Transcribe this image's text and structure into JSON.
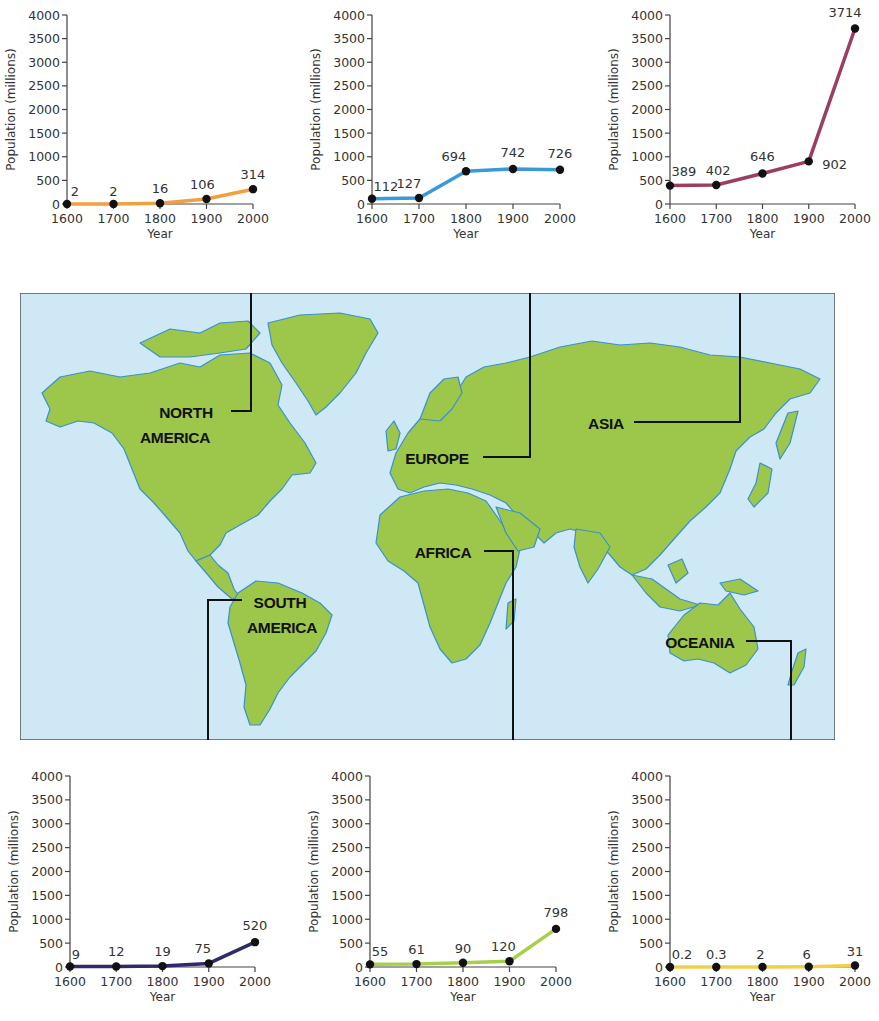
{
  "figure": {
    "map": {
      "ocean_color": "#cfe8f5",
      "land_color": "#9dc74a",
      "coast_color": "#3a8fd0",
      "regions": [
        {
          "key": "north_america",
          "label_lines": [
            "NORTH",
            "AMERICA"
          ]
        },
        {
          "key": "europe",
          "label_lines": [
            "EUROPE"
          ]
        },
        {
          "key": "asia",
          "label_lines": [
            "ASIA"
          ]
        },
        {
          "key": "africa",
          "label_lines": [
            "AFRICA"
          ]
        },
        {
          "key": "south_america",
          "label_lines": [
            "SOUTH",
            "AMERICA"
          ]
        },
        {
          "key": "oceania",
          "label_lines": [
            "OCEANIA"
          ]
        }
      ]
    }
  },
  "labels": {
    "na1": "NORTH",
    "na2": "AMERICA",
    "eu": "EUROPE",
    "as": "ASIA",
    "af": "AFRICA",
    "sa1": "SOUTH",
    "sa2": "AMERICA",
    "oc": "OCEANIA"
  },
  "chart_data": [
    {
      "type": "line",
      "region": "North America",
      "title": "",
      "xlabel": "Year",
      "ylabel": "Population (millions)",
      "x": [
        1600,
        1700,
        1800,
        1900,
        2000
      ],
      "values": [
        2,
        2,
        16,
        106,
        314
      ],
      "value_labels": [
        "2",
        "2",
        "16",
        "106",
        "314"
      ],
      "color": "#f0a040",
      "ylim": [
        0,
        4000
      ],
      "yticks": [
        0,
        500,
        1000,
        1500,
        2000,
        2500,
        3000,
        3500,
        4000
      ],
      "grid": false,
      "legend": null
    },
    {
      "type": "line",
      "region": "Europe",
      "title": "",
      "xlabel": "Year",
      "ylabel": "Population (millions)",
      "x": [
        1600,
        1700,
        1800,
        1900,
        2000
      ],
      "values": [
        112,
        127,
        694,
        742,
        726
      ],
      "value_labels": [
        "112",
        "127",
        "694",
        "742",
        "726"
      ],
      "color": "#3a9ad9",
      "ylim": [
        0,
        4000
      ],
      "yticks": [
        0,
        500,
        1000,
        1500,
        2000,
        2500,
        3000,
        3500,
        4000
      ],
      "grid": false,
      "legend": null
    },
    {
      "type": "line",
      "region": "Asia",
      "title": "",
      "xlabel": "Year",
      "ylabel": "Population (millions)",
      "x": [
        1600,
        1700,
        1800,
        1900,
        2000
      ],
      "values": [
        389,
        402,
        646,
        902,
        3714
      ],
      "value_labels": [
        "389",
        "402",
        "646",
        "902",
        "3714"
      ],
      "color": "#9c3e63",
      "ylim": [
        0,
        4000
      ],
      "yticks": [
        0,
        500,
        1000,
        1500,
        2000,
        2500,
        3000,
        3500,
        4000
      ],
      "grid": false,
      "legend": null
    },
    {
      "type": "line",
      "region": "South America",
      "title": "",
      "xlabel": "Year",
      "ylabel": "Population (millions)",
      "x": [
        1600,
        1700,
        1800,
        1900,
        2000
      ],
      "values": [
        9,
        12,
        19,
        75,
        520
      ],
      "value_labels": [
        "9",
        "12",
        "19",
        "75",
        "520"
      ],
      "color": "#2e2a6b",
      "ylim": [
        0,
        4000
      ],
      "yticks": [
        0,
        500,
        1000,
        1500,
        2000,
        2500,
        3000,
        3500,
        4000
      ],
      "grid": false,
      "legend": null
    },
    {
      "type": "line",
      "region": "Africa",
      "title": "",
      "xlabel": "Year",
      "ylabel": "Population (millions)",
      "x": [
        1600,
        1700,
        1800,
        1900,
        2000
      ],
      "values": [
        55,
        61,
        90,
        120,
        798
      ],
      "value_labels": [
        "55",
        "61",
        "90",
        "120",
        "798"
      ],
      "color": "#a8cf4a",
      "ylim": [
        0,
        4000
      ],
      "yticks": [
        0,
        500,
        1000,
        1500,
        2000,
        2500,
        3000,
        3500,
        4000
      ],
      "grid": false,
      "legend": null
    },
    {
      "type": "line",
      "region": "Oceania",
      "title": "",
      "xlabel": "Year",
      "ylabel": "Population (millions)",
      "x": [
        1600,
        1700,
        1800,
        1900,
        2000
      ],
      "values": [
        0.2,
        0.3,
        2,
        6,
        31
      ],
      "value_labels": [
        "0.2",
        "0.3",
        "2",
        "6",
        "31"
      ],
      "color": "#f2cf4a",
      "ylim": [
        0,
        4000
      ],
      "yticks": [
        0,
        500,
        1000,
        1500,
        2000,
        2500,
        3000,
        3500,
        4000
      ],
      "grid": false,
      "legend": null
    }
  ]
}
